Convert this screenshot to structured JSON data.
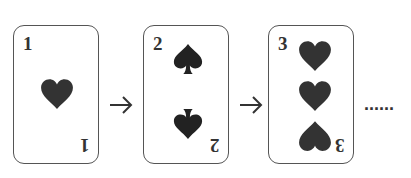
{
  "diagram": {
    "colors": {
      "ink": "#333333",
      "border": "#555555",
      "background": "#ffffff"
    },
    "cards": [
      {
        "rank": "1",
        "suit": "heart",
        "pip_count": 1
      },
      {
        "rank": "2",
        "suit": "spade",
        "pip_count": 2
      },
      {
        "rank": "3",
        "suit": "heart",
        "pip_count": 3
      }
    ],
    "connectors": [
      "arrow-right",
      "arrow-right"
    ],
    "continuation": "......"
  }
}
